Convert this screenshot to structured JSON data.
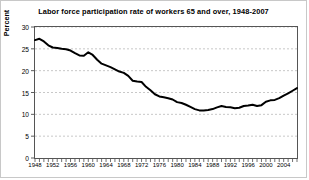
{
  "chart_data": {
    "type": "line",
    "title": "Labor force participation rate of workers 65 and over, 1948-2007",
    "xlabel": "",
    "ylabel": "Percent",
    "ylim": [
      0,
      30
    ],
    "ytick_values": [
      0,
      5,
      10,
      15,
      20,
      25,
      30
    ],
    "xlim": [
      1948,
      2007
    ],
    "xtick_labels": [
      "1948",
      "1952",
      "1956",
      "1960",
      "1964",
      "1968",
      "1972",
      "1976",
      "1980",
      "1984",
      "1988",
      "1992",
      "1996",
      "2000",
      "2004"
    ],
    "xtick_values": [
      1948,
      1952,
      1956,
      1960,
      1964,
      1968,
      1972,
      1976,
      1980,
      1984,
      1988,
      1992,
      1996,
      2000,
      2004
    ],
    "minor_tick_interval": 1,
    "grid": "horizontal-dashed",
    "legend": "none",
    "line_color": "#000000",
    "x": [
      1948,
      1949,
      1950,
      1951,
      1952,
      1953,
      1954,
      1955,
      1956,
      1957,
      1958,
      1959,
      1960,
      1961,
      1962,
      1963,
      1964,
      1965,
      1966,
      1967,
      1968,
      1969,
      1970,
      1971,
      1972,
      1973,
      1974,
      1975,
      1976,
      1977,
      1978,
      1979,
      1980,
      1981,
      1982,
      1983,
      1984,
      1985,
      1986,
      1987,
      1988,
      1989,
      1990,
      1991,
      1992,
      1993,
      1994,
      1995,
      1996,
      1997,
      1998,
      1999,
      2000,
      2001,
      2002,
      2003,
      2004,
      2005,
      2006,
      2007
    ],
    "values": [
      27.0,
      27.3,
      26.7,
      25.8,
      25.3,
      25.2,
      25.0,
      24.9,
      24.6,
      24.0,
      23.5,
      23.4,
      24.2,
      23.6,
      22.5,
      21.6,
      21.2,
      20.8,
      20.3,
      19.8,
      19.5,
      18.8,
      17.7,
      17.5,
      17.4,
      16.3,
      15.5,
      14.6,
      14.1,
      13.9,
      13.7,
      13.4,
      12.8,
      12.6,
      12.2,
      11.7,
      11.2,
      10.9,
      10.9,
      11.0,
      11.2,
      11.6,
      11.9,
      11.7,
      11.6,
      11.4,
      11.5,
      11.9,
      12.0,
      12.2,
      11.9,
      12.1,
      12.9,
      13.2,
      13.3,
      13.7,
      14.3,
      14.8,
      15.4,
      16.0
    ]
  }
}
